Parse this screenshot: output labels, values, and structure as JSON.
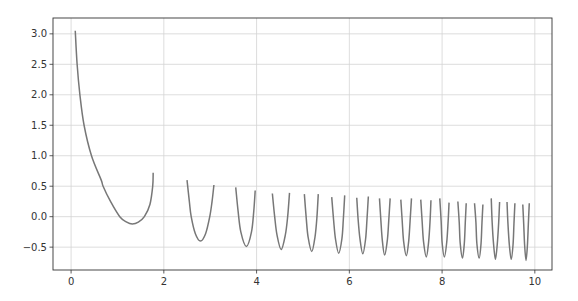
{
  "chart_data": {
    "type": "line",
    "title": "",
    "xlabel": "",
    "ylabel": "",
    "xlim": [
      -0.39,
      10.37
    ],
    "ylim": [
      -0.875,
      3.26
    ],
    "grid": true,
    "legend": null,
    "x_ticks": [
      0,
      2,
      4,
      6,
      8,
      10
    ],
    "x_tick_labels": [
      "0",
      "2",
      "4",
      "6",
      "8",
      "10"
    ],
    "y_ticks": [
      3.0,
      2.5,
      2.0,
      1.5,
      1.0,
      0.5,
      0.0,
      -0.5
    ],
    "y_tick_labels": [
      "3.0",
      "2.5",
      "2.0",
      "1.5",
      "1.0",
      "0.5",
      "0.0",
      "−0.5"
    ],
    "series": [
      {
        "name": "f(x)",
        "color": "#777777",
        "segments": [
          {
            "x": [
              0.09,
              0.13,
              0.19,
              0.28,
              0.44,
              0.65,
              0.69,
              0.85,
              1.05,
              1.2,
              1.32,
              1.45,
              1.58,
              1.7,
              1.76,
              1.77
            ],
            "y": [
              3.05,
              2.5,
              2.0,
              1.5,
              1.0,
              0.6,
              0.5,
              0.25,
              0.0,
              -0.09,
              -0.12,
              -0.09,
              0.0,
              0.2,
              0.5,
              0.72
            ]
          },
          {
            "x": [
              2.5,
              2.55,
              2.59,
              2.68,
              2.79,
              2.9,
              2.99,
              3.04,
              3.08
            ],
            "y": [
              0.6,
              0.25,
              0.0,
              -0.28,
              -0.4,
              -0.28,
              0.0,
              0.25,
              0.52
            ]
          },
          {
            "x": [
              3.55,
              3.6,
              3.66,
              3.78,
              3.89,
              3.94,
              3.97
            ],
            "y": [
              0.48,
              0.1,
              -0.25,
              -0.49,
              -0.25,
              0.1,
              0.43
            ]
          },
          {
            "x": [
              4.34,
              4.39,
              4.44,
              4.53,
              4.62,
              4.67,
              4.71
            ],
            "y": [
              0.38,
              0.0,
              -0.3,
              -0.54,
              -0.3,
              0.0,
              0.39
            ]
          },
          {
            "x": [
              5.03,
              5.07,
              5.11,
              5.19,
              5.26,
              5.3,
              5.33
            ],
            "y": [
              0.37,
              -0.02,
              -0.33,
              -0.57,
              -0.33,
              -0.02,
              0.37
            ]
          },
          {
            "x": [
              5.62,
              5.66,
              5.7,
              5.77,
              5.84,
              5.87,
              5.9
            ],
            "y": [
              0.32,
              -0.05,
              -0.36,
              -0.6,
              -0.36,
              -0.05,
              0.35
            ]
          },
          {
            "x": [
              6.16,
              6.19,
              6.23,
              6.29,
              6.35,
              6.38,
              6.41
            ],
            "y": [
              0.31,
              -0.05,
              -0.37,
              -0.61,
              -0.37,
              -0.05,
              0.33
            ]
          },
          {
            "x": [
              6.65,
              6.68,
              6.71,
              6.76,
              6.82,
              6.85,
              6.88
            ],
            "y": [
              0.3,
              -0.06,
              -0.38,
              -0.63,
              -0.38,
              -0.06,
              0.3
            ]
          },
          {
            "x": [
              7.11,
              7.14,
              7.17,
              7.23,
              7.28,
              7.31,
              7.34
            ],
            "y": [
              0.28,
              -0.07,
              -0.4,
              -0.64,
              -0.4,
              -0.07,
              0.3
            ]
          },
          {
            "x": [
              7.54,
              7.57,
              7.6,
              7.66,
              7.71,
              7.74,
              7.76
            ],
            "y": [
              0.28,
              -0.08,
              -0.41,
              -0.66,
              -0.41,
              -0.08,
              0.27
            ]
          },
          {
            "x": [
              7.95,
              7.98,
              8.0,
              8.05,
              8.1,
              8.13,
              8.15
            ],
            "y": [
              0.3,
              -0.08,
              -0.42,
              -0.66,
              -0.42,
              -0.08,
              0.23
            ]
          },
          {
            "x": [
              8.34,
              8.37,
              8.39,
              8.44,
              8.48,
              8.5,
              8.52
            ],
            "y": [
              0.25,
              -0.1,
              -0.43,
              -0.68,
              -0.43,
              -0.1,
              0.22
            ]
          },
          {
            "x": [
              8.7,
              8.73,
              8.75,
              8.8,
              8.84,
              8.86,
              8.88
            ],
            "y": [
              0.22,
              -0.1,
              -0.44,
              -0.68,
              -0.44,
              -0.1,
              0.2
            ]
          },
          {
            "x": [
              9.06,
              9.08,
              9.11,
              9.15,
              9.19,
              9.22,
              9.24
            ],
            "y": [
              0.3,
              -0.1,
              -0.45,
              -0.7,
              -0.45,
              -0.1,
              0.24
            ]
          },
          {
            "x": [
              9.4,
              9.42,
              9.45,
              9.49,
              9.53,
              9.55,
              9.57
            ],
            "y": [
              0.24,
              -0.11,
              -0.46,
              -0.7,
              -0.46,
              -0.11,
              0.22
            ]
          },
          {
            "x": [
              9.74,
              9.76,
              9.78,
              9.81,
              9.84,
              9.86,
              9.88
            ],
            "y": [
              0.2,
              -0.12,
              -0.47,
              -0.72,
              -0.47,
              -0.12,
              0.22
            ]
          }
        ]
      }
    ]
  },
  "plot_area": {
    "left": 53,
    "top": 18,
    "right": 552,
    "bottom": 270
  },
  "style": {
    "line_color": "#777777",
    "grid_color": "#d4d4d4",
    "axis_color": "#333333",
    "text_color": "#333333",
    "background": "#ffffff"
  }
}
